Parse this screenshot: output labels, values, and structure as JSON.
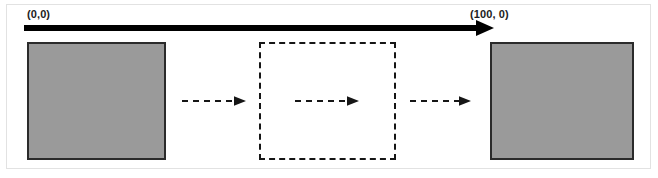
{
  "figure": {
    "width": 658,
    "height": 178,
    "background_color": "#ffffff",
    "frame_color": "#e2e2e2"
  },
  "axis": {
    "origin_label": "(0,0)",
    "end_label": "(100, 0)",
    "line_color": "#000000",
    "line_thickness_px": 6,
    "direction": "left-to-right",
    "has_arrowhead": true
  },
  "blocks": [
    {
      "id": "block-start",
      "role": "start-position-block",
      "fill_color": "#9a9a9a",
      "border_color": "#2b2b2b",
      "style": "solid"
    },
    {
      "id": "block-end",
      "role": "end-position-block",
      "fill_color": "#9a9a9a",
      "border_color": "#2b2b2b",
      "style": "solid"
    }
  ],
  "region": {
    "id": "dashed-region",
    "role": "intermediate-position-outline",
    "border_color": "#161616",
    "style": "dashed",
    "fill": "none"
  },
  "motion_arrows": [
    {
      "id": "dashed-arrow-1",
      "style": "dashed",
      "color": "#161616",
      "direction": "right"
    },
    {
      "id": "dashed-arrow-2",
      "style": "dashed",
      "color": "#161616",
      "direction": "right"
    },
    {
      "id": "dashed-arrow-3",
      "style": "dashed",
      "color": "#161616",
      "direction": "right"
    }
  ]
}
